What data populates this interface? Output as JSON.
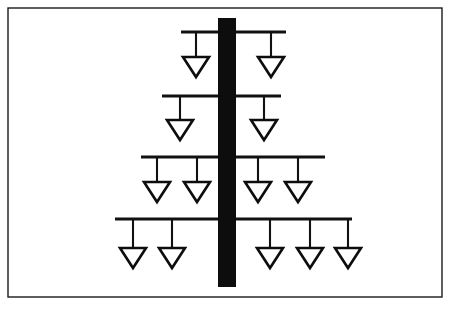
{
  "figure": {
    "canvas": {
      "width": 452,
      "height": 309
    },
    "colors": {
      "background": "#ffffff",
      "ink": "#111111",
      "mast": "#0d0d0d",
      "frame": "#1a1a1a",
      "node_fill": "#ffffff"
    }
  },
  "frame": {
    "label": "outer-border",
    "x": 8,
    "y": 8,
    "width": 434,
    "height": 289
  },
  "mast": {
    "label": "vertical-mast",
    "x": 218,
    "y": 18,
    "width": 18,
    "height": 269,
    "center_x": 227
  },
  "node_shape": {
    "type": "triangle-down",
    "half_width": 13,
    "height": 20
  },
  "rows": [
    {
      "index": 1,
      "label": "branch-row-1",
      "bar_y": 32,
      "bar_x1": 181,
      "bar_x2": 286,
      "node_top_y": 57,
      "node_count": 2,
      "node_centers": [
        196,
        271
      ]
    },
    {
      "index": 2,
      "label": "branch-row-2",
      "bar_y": 96,
      "bar_x1": 162,
      "bar_x2": 281,
      "node_top_y": 120,
      "node_count": 2,
      "node_centers": [
        180,
        264
      ]
    },
    {
      "index": 3,
      "label": "branch-row-3",
      "bar_y": 157,
      "bar_x1": 141,
      "bar_x2": 325,
      "node_top_y": 182,
      "node_count": 4,
      "node_centers": [
        157,
        197,
        258,
        298
      ]
    },
    {
      "index": 4,
      "label": "branch-row-4",
      "bar_y": 219,
      "bar_x1": 115,
      "bar_x2": 352,
      "node_top_y": 248,
      "node_count": 5,
      "node_centers": [
        133,
        172,
        270,
        310,
        348
      ]
    }
  ]
}
